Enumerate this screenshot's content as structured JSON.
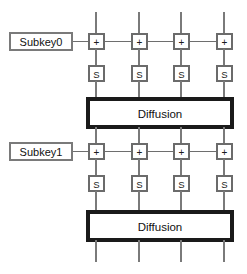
{
  "diagram": {
    "name": "substitution-permutation-network",
    "background_color": "#ffffff",
    "wire_color": "#7a7a7a",
    "box_stroke_color": "#6b6b6b",
    "diffusion_stroke_color": "#1a1a1a",
    "text_color": "#1a1a1a",
    "lane_count": 4,
    "lane_x": [
      96,
      139,
      181,
      224
    ],
    "rounds": [
      {
        "index": 0,
        "subkey": {
          "label": "Subkey0",
          "box": {
            "x": 10,
            "y": 33,
            "width": 62,
            "height": 17
          },
          "connector": {
            "x1": 72,
            "x2": 89,
            "y": 41.5
          }
        },
        "xor_row": {
          "glyph": "+",
          "y": 34,
          "size": 15,
          "bus_y": 41.5
        },
        "sbox_row": {
          "glyph": "S",
          "y": 66,
          "size": 15
        },
        "diffusion": {
          "label": "Diffusion",
          "x": 88,
          "y": 99,
          "width": 144,
          "height": 28
        }
      },
      {
        "index": 1,
        "subkey": {
          "label": "Subkey1",
          "box": {
            "x": 10,
            "y": 143,
            "width": 62,
            "height": 17
          },
          "connector": {
            "x1": 72,
            "x2": 89,
            "y": 151.5
          }
        },
        "xor_row": {
          "glyph": "+",
          "y": 144,
          "size": 15,
          "bus_y": 151.5
        },
        "sbox_row": {
          "glyph": "S",
          "y": 176,
          "size": 15
        },
        "diffusion": {
          "label": "Diffusion",
          "x": 88,
          "y": 212,
          "width": 144,
          "height": 28
        }
      }
    ],
    "input_wires": {
      "y_top": 12,
      "y_bottom": 34
    },
    "output_wires": {
      "y_top": 240,
      "y_bottom": 262
    }
  }
}
